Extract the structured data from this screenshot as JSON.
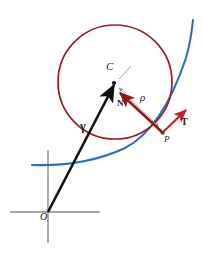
{
  "figure": {
    "colors": {
      "curve": "#2e6fbd",
      "circle": "#9e1b20",
      "vector_normal": "#8f1a1f",
      "vector_tangent": "#c0272d",
      "axis": "#8a8a8a",
      "radius_arrow": "#9a9a9a",
      "position_vector": "#111111",
      "label": "#1a1a1a"
    },
    "labels": [
      {
        "name": "center-label",
        "text": "C",
        "x": 106,
        "y": 67,
        "size": 10,
        "style": "italic"
      },
      {
        "name": "normal-vector-label",
        "text": "N",
        "x": 117,
        "y": 99,
        "size": 9,
        "style": "bold"
      },
      {
        "name": "radius-label",
        "text": "ρ",
        "x": 140,
        "y": 95,
        "size": 10,
        "style": "italic"
      },
      {
        "name": "tangent-vector-label",
        "text": "T",
        "x": 181,
        "y": 118,
        "size": 9,
        "style": "bold"
      },
      {
        "name": "point-p-label",
        "text": "P",
        "x": 165,
        "y": 137,
        "size": 9,
        "style": "italic"
      },
      {
        "name": "position-vector-label",
        "text": "γ",
        "x": 81,
        "y": 122,
        "size": 11,
        "style": "bold"
      },
      {
        "name": "origin-label",
        "text": "O",
        "x": 40,
        "y": 213,
        "size": 9,
        "style": "italic"
      }
    ],
    "geometry": {
      "circle": {
        "cx": 115,
        "cy": 82,
        "r": 57
      },
      "point_c": {
        "x": 114,
        "y": 83
      },
      "point_p": {
        "x": 163,
        "y": 133
      },
      "origin": {
        "x": 48,
        "y": 212
      },
      "axis_horizontal": {
        "x1": 10,
        "x2": 100,
        "y": 212
      },
      "axis_vertical": {
        "x": 48,
        "y1": 150,
        "y2": 243
      },
      "curve_path": "M 32 165 C 60 166 95 162 125 148 C 152 134 172 100 186 58 C 190 44 192 30 193 20",
      "tangent_arrow": {
        "x1": 163,
        "y1": 133,
        "x2": 186,
        "y2": 110
      },
      "normal_arrow": {
        "x1": 163,
        "y1": 133,
        "x2": 118,
        "y2": 92
      },
      "radius_arrow": {
        "x1": 118,
        "y1": 87,
        "x2": 160,
        "y2": 128
      },
      "tick_at_center": {
        "x1": 118,
        "y1": 78,
        "x2": 130,
        "y2": 66
      },
      "gamma_arrow": {
        "x1": 48,
        "y1": 212,
        "x2": 114,
        "y2": 84
      }
    }
  }
}
